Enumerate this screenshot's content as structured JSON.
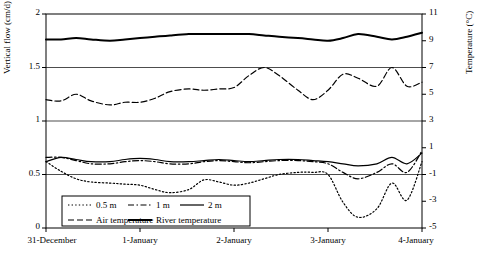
{
  "chart_data": {
    "type": "line",
    "title": "",
    "xlabel": "",
    "ylabel": "Vertical flow (cm/d)",
    "ylabel_right": "Temperature (°C)",
    "ylim": [
      0,
      2
    ],
    "ylim_right": [
      -5,
      11
    ],
    "yticks": [
      "0",
      "0.5",
      "1",
      "1.5",
      "2"
    ],
    "yticks_right": [
      "-5",
      "-3",
      "-1",
      "1",
      "3",
      "5",
      "7",
      "9",
      "11"
    ],
    "xticks": [
      "31-December",
      "1-January",
      "2-January",
      "3-January",
      "4-January"
    ],
    "grid": false,
    "legend_position": "inside-bottom-left",
    "series": [
      {
        "name": "0.5 m",
        "axis": "left",
        "style": "dotted",
        "x": [
          0,
          0.04,
          0.08,
          0.12,
          0.17,
          0.21,
          0.25,
          0.29,
          0.33,
          0.38,
          0.42,
          0.46,
          0.5,
          0.54,
          0.58,
          0.62,
          0.67,
          0.71,
          0.75,
          0.79,
          0.83,
          0.88,
          0.92,
          0.96,
          1.0
        ],
        "values": [
          0.62,
          0.53,
          0.46,
          0.43,
          0.42,
          0.41,
          0.4,
          0.36,
          0.33,
          0.36,
          0.45,
          0.43,
          0.4,
          0.42,
          0.46,
          0.5,
          0.52,
          0.52,
          0.5,
          0.24,
          0.1,
          0.18,
          0.42,
          0.26,
          0.62
        ]
      },
      {
        "name": "1 m",
        "axis": "left",
        "style": "dash-dot",
        "x": [
          0,
          0.04,
          0.08,
          0.12,
          0.17,
          0.21,
          0.25,
          0.29,
          0.33,
          0.38,
          0.42,
          0.46,
          0.5,
          0.54,
          0.58,
          0.62,
          0.67,
          0.71,
          0.75,
          0.79,
          0.83,
          0.88,
          0.92,
          0.96,
          1.0
        ],
        "values": [
          0.66,
          0.66,
          0.63,
          0.6,
          0.6,
          0.62,
          0.63,
          0.62,
          0.6,
          0.6,
          0.62,
          0.63,
          0.62,
          0.61,
          0.62,
          0.63,
          0.63,
          0.62,
          0.6,
          0.52,
          0.46,
          0.52,
          0.6,
          0.52,
          0.72
        ]
      },
      {
        "name": "2 m",
        "axis": "left",
        "style": "solid",
        "x": [
          0,
          0.04,
          0.08,
          0.12,
          0.17,
          0.21,
          0.25,
          0.29,
          0.33,
          0.38,
          0.42,
          0.46,
          0.5,
          0.54,
          0.58,
          0.62,
          0.67,
          0.71,
          0.75,
          0.79,
          0.83,
          0.88,
          0.92,
          0.96,
          1.0
        ],
        "values": [
          0.62,
          0.66,
          0.64,
          0.62,
          0.62,
          0.64,
          0.65,
          0.64,
          0.62,
          0.62,
          0.63,
          0.64,
          0.63,
          0.62,
          0.63,
          0.64,
          0.64,
          0.63,
          0.62,
          0.6,
          0.58,
          0.6,
          0.66,
          0.6,
          0.7
        ]
      },
      {
        "name": "Air temperature",
        "axis": "right",
        "style": "dashed",
        "x": [
          0,
          0.04,
          0.08,
          0.12,
          0.17,
          0.21,
          0.25,
          0.29,
          0.33,
          0.38,
          0.42,
          0.46,
          0.5,
          0.54,
          0.58,
          0.62,
          0.67,
          0.71,
          0.75,
          0.79,
          0.83,
          0.88,
          0.92,
          0.96,
          1.0
        ],
        "values": [
          4.6,
          4.5,
          5.0,
          4.5,
          4.2,
          4.4,
          4.4,
          4.7,
          5.2,
          5.4,
          5.3,
          5.4,
          5.5,
          6.4,
          7.0,
          6.4,
          5.3,
          4.6,
          5.3,
          6.5,
          6.2,
          5.6,
          7.0,
          5.6,
          5.9
        ]
      },
      {
        "name": "River temperature",
        "axis": "right",
        "style": "solid-thick",
        "x": [
          0,
          0.04,
          0.08,
          0.12,
          0.17,
          0.21,
          0.25,
          0.29,
          0.33,
          0.38,
          0.42,
          0.46,
          0.5,
          0.54,
          0.58,
          0.62,
          0.67,
          0.71,
          0.75,
          0.79,
          0.83,
          0.88,
          0.92,
          0.96,
          1.0
        ],
        "values": [
          9.1,
          9.1,
          9.2,
          9.1,
          9.0,
          9.1,
          9.2,
          9.3,
          9.4,
          9.5,
          9.5,
          9.5,
          9.5,
          9.5,
          9.4,
          9.3,
          9.2,
          9.1,
          9.0,
          9.2,
          9.5,
          9.3,
          9.1,
          9.3,
          9.6
        ]
      }
    ],
    "legend": [
      {
        "label": "0.5 m",
        "style": "dotted"
      },
      {
        "label": "1 m",
        "style": "dash-dot"
      },
      {
        "label": "2 m",
        "style": "solid"
      },
      {
        "label": "Air temperature",
        "style": "dashed"
      },
      {
        "label": "River temperature",
        "style": "solid-thick"
      }
    ]
  }
}
